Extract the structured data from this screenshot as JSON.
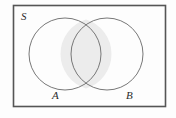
{
  "figure": {
    "kind": "venn-diagram",
    "width": 176,
    "height": 118,
    "background_color": "#fdfdfd"
  },
  "universal_set": {
    "label": "S",
    "label_x": 21,
    "label_y": 20,
    "font_size": 11,
    "rect": {
      "x": 13.5,
      "y": 5.5,
      "width": 152,
      "height": 101
    },
    "stroke_color": "#555555",
    "stroke_width": 1.6,
    "fill_color": "#fdfdfd"
  },
  "circles": [
    {
      "label": "A",
      "cx": 65,
      "cy": 54,
      "r": 36,
      "stroke_color": "#787878",
      "stroke_width": 1,
      "fill_color": "none",
      "label_x": 52,
      "label_y": 99,
      "font_size": 11
    },
    {
      "label": "B",
      "cx": 107,
      "cy": 54,
      "r": 36,
      "stroke_color": "#787878",
      "stroke_width": 1,
      "fill_color": "none",
      "label_x": 126,
      "label_y": 99,
      "font_size": 11
    }
  ],
  "intersection": {
    "name": "A-intersect-B",
    "label": "",
    "shaded": true,
    "fill_color": "#ececec",
    "stroke_color": "#787878",
    "stroke_width": 1,
    "lens_path": "M 86 19.57 A 36 36 0 0 1 86 88.43 A 36 36 0 0 1 86 19.57 Z",
    "top_crossing": {
      "x": 86,
      "y": 19.57
    },
    "bottom_crossing": {
      "x": 86,
      "y": 88.43
    }
  },
  "colors": {
    "frame_stroke": "#555555",
    "circle_stroke": "#787878",
    "shade_fill": "#ececec",
    "text": "#2b2b2b",
    "background": "#fdfdfd"
  }
}
